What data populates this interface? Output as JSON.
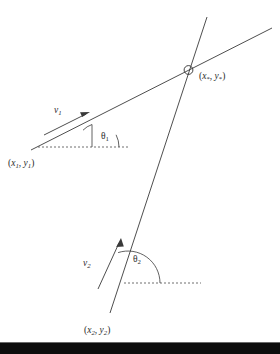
{
  "figure": {
    "background_color": "#ffffff",
    "ink_color": "#3a3a3a",
    "bottom_bar_color": "#0d0d0d"
  },
  "labels": {
    "point1": {
      "open": "(",
      "x": "x",
      "xsub": "1",
      "comma": ", ",
      "y": "y",
      "ysub": "1",
      "close": ")"
    },
    "point2": {
      "open": "(",
      "x": "x",
      "xsub": "2",
      "comma": ", ",
      "y": "y",
      "ysub": "2",
      "close": ")"
    },
    "intersection": {
      "open": "(",
      "x": "x",
      "xsub": "*",
      "comma": ", ",
      "y": "y",
      "ysub": "*",
      "close": ")"
    },
    "vector1": {
      "symbol": "v",
      "sub": "1"
    },
    "vector2": {
      "symbol": "v",
      "sub": "2"
    },
    "angle1": {
      "symbol": "θ",
      "sub": "1"
    },
    "angle2": {
      "symbol": "θ",
      "sub": "2"
    }
  },
  "geometry": {
    "line1": {
      "x1": 31,
      "y1": 150,
      "x2": 272,
      "y2": 28,
      "name": "ray-from-point-1"
    },
    "line2": {
      "x1": 110,
      "y1": 313,
      "x2": 207,
      "y2": 17,
      "name": "ray-from-point-2"
    },
    "intersection_point": {
      "cx": 188.5,
      "cy": 70,
      "r": 4.4
    },
    "dashed1": {
      "x1": 38,
      "y1": 147,
      "x2": 129,
      "y2": 147
    },
    "dashed2": {
      "x1": 124,
      "y1": 283,
      "x2": 201,
      "y2": 283
    },
    "vector1_arrow": {
      "x1": 44,
      "y1": 135,
      "x2": 88,
      "y2": 113
    },
    "vector2_arrow": {
      "x1": 98,
      "y1": 288,
      "x2": 120,
      "y2": 239
    },
    "angle1_arc": {
      "cx": 92,
      "cy": 147,
      "r": 27,
      "start_deg": 0,
      "end_deg": 26.8
    },
    "angle2_arc": {
      "cx": 128,
      "cy": 283,
      "r": 32,
      "start_deg": 0,
      "end_deg": 71.9
    }
  },
  "positions": {
    "point1_label": {
      "x": 8,
      "y": 166
    },
    "point2_label": {
      "x": 84,
      "y": 333
    },
    "intersection_label": {
      "x": 199,
      "y": 79
    },
    "vector1_label": {
      "x": 54,
      "y": 113
    },
    "vector2_label": {
      "x": 83,
      "y": 266
    },
    "angle1_label": {
      "x": 101,
      "y": 139
    },
    "angle2_label": {
      "x": 133,
      "y": 262
    }
  }
}
